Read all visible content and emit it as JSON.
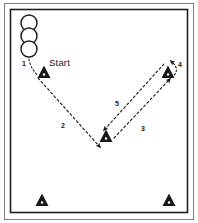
{
  "diagram": {
    "background_color": "#ffffff",
    "ink_color": "#17171a",
    "frame": {
      "outer_color": "#555558",
      "inner_color": "#1f1f22"
    },
    "start_label": "Start",
    "steps": [
      {
        "id": "step-1",
        "label": "1",
        "x": 22,
        "y": 60
      },
      {
        "id": "step-2",
        "label": "2",
        "x": 61,
        "y": 122
      },
      {
        "id": "step-3",
        "label": "3",
        "x": 141,
        "y": 125
      },
      {
        "id": "step-4",
        "label": "4",
        "x": 178,
        "y": 61
      },
      {
        "id": "step-5",
        "label": "5",
        "x": 115,
        "y": 100
      }
    ],
    "cones": [
      {
        "id": "cone-start",
        "name": "start-cone",
        "x": 44,
        "y": 73
      },
      {
        "id": "cone-right",
        "name": "right-cone",
        "x": 168,
        "y": 73
      },
      {
        "id": "cone-center",
        "name": "center-cone",
        "x": 106,
        "y": 137
      },
      {
        "id": "cone-bottom-left",
        "name": "bottom-left-cone",
        "x": 42,
        "y": 201
      },
      {
        "id": "cone-bottom-right",
        "name": "bottom-right-cone",
        "x": 169,
        "y": 201
      }
    ],
    "players": [
      {
        "id": "player-1",
        "name": "player-queue-circle-1",
        "x": 29,
        "y": 23,
        "r": 8
      },
      {
        "id": "player-2",
        "name": "player-queue-circle-2",
        "x": 29,
        "y": 36,
        "r": 8
      },
      {
        "id": "player-3",
        "name": "player-queue-circle-3",
        "x": 29,
        "y": 49,
        "r": 8
      }
    ],
    "paths": [
      {
        "id": "path-1",
        "name": "path-segment-1",
        "from": "player-queue",
        "to": "start-cone"
      },
      {
        "id": "path-2",
        "name": "path-segment-2",
        "from": "start-cone",
        "to": "center-cone"
      },
      {
        "id": "path-3",
        "name": "path-segment-3",
        "from": "center-cone",
        "to": "right-cone"
      },
      {
        "id": "path-4",
        "name": "path-segment-4",
        "from": "right-cone",
        "to": "right-cone-turn"
      },
      {
        "id": "path-5",
        "name": "path-segment-5",
        "from": "right-cone",
        "to": "center-cone"
      }
    ]
  }
}
